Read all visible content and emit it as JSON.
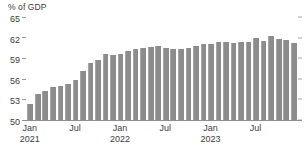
{
  "chart_data": {
    "type": "bar",
    "title": "",
    "subtitle": "",
    "unit_label": "% of GDP",
    "xlabel": "",
    "ylabel": "% of GDP",
    "ylim": [
      50,
      65
    ],
    "y_ticks": [
      50,
      53,
      56,
      59,
      62,
      65
    ],
    "y_tick_labels": [
      "50",
      "53",
      "56",
      "59",
      "62",
      "65"
    ],
    "grid": false,
    "legend": null,
    "legend_position": "none",
    "bar_color": "#8c8c8c",
    "axis_color": "#8f8f8f",
    "text_color": "#3c3c3c",
    "x_tick_labels": [
      {
        "line1": "Jan",
        "line2": "2021",
        "index": 0
      },
      {
        "line1": "Jul",
        "line2": "",
        "index": 6
      },
      {
        "line1": "Jan",
        "line2": "2022",
        "index": 12
      },
      {
        "line1": "Jul",
        "line2": "",
        "index": 18
      },
      {
        "line1": "Jan",
        "line2": "2023",
        "index": 24
      },
      {
        "line1": "Jul",
        "line2": "",
        "index": 30
      }
    ],
    "categories": [
      "Jan 2021",
      "Feb 2021",
      "Mar 2021",
      "Apr 2021",
      "May 2021",
      "Jun 2021",
      "Jul 2021",
      "Aug 2021",
      "Sep 2021",
      "Oct 2021",
      "Nov 2021",
      "Dec 2021",
      "Jan 2022",
      "Feb 2022",
      "Mar 2022",
      "Apr 2022",
      "May 2022",
      "Jun 2022",
      "Jul 2022",
      "Aug 2022",
      "Sep 2022",
      "Oct 2022",
      "Nov 2022",
      "Dec 2022",
      "Jan 2023",
      "Feb 2023",
      "Mar 2023",
      "Apr 2023",
      "May 2023",
      "Jun 2023",
      "Jul 2023",
      "Aug 2023",
      "Sep 2023",
      "Oct 2023",
      "Nov 2023",
      "Dec 2023"
    ],
    "values": [
      52.4,
      53.8,
      54.2,
      54.8,
      55.0,
      55.3,
      55.9,
      57.2,
      58.3,
      58.8,
      59.6,
      59.4,
      59.6,
      60.1,
      60.4,
      60.5,
      60.6,
      60.8,
      60.5,
      60.4,
      60.4,
      60.5,
      60.8,
      61.0,
      61.0,
      61.4,
      61.4,
      61.2,
      61.3,
      61.3,
      61.9,
      61.5,
      62.2,
      61.8,
      61.6,
      61.2
    ]
  }
}
